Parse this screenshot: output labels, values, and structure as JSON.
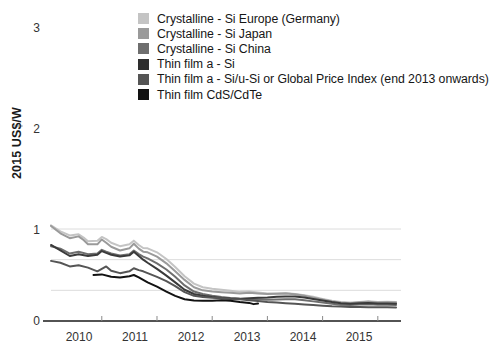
{
  "chart_data": {
    "type": "line",
    "title": "",
    "xlabel": "",
    "ylabel": "2015 US$/W",
    "xlim": [
      2009.58,
      2015.92
    ],
    "ylim": [
      0,
      3.25
    ],
    "grid": true,
    "gridlines_y": [
      1,
      2,
      3
    ],
    "legend_position": "top-right",
    "xticks": [
      "2010",
      "2011",
      "2012",
      "2013",
      "2014",
      "2015"
    ],
    "yticks": [
      "0",
      "1",
      "2",
      "3"
    ],
    "series": [
      {
        "name": "Crystalline - Si Europe (Germany)",
        "color": "#c4c4c4",
        "x": [
          2009.58,
          2009.75,
          2009.92,
          2010.08,
          2010.17,
          2010.25,
          2010.42,
          2010.5,
          2010.58,
          2010.67,
          2010.83,
          2011.0,
          2011.08,
          2011.17,
          2011.25,
          2011.33,
          2011.5,
          2011.67,
          2011.83,
          2012.0,
          2012.17,
          2012.33,
          2012.5,
          2012.67,
          2012.83,
          2013.0,
          2013.17,
          2013.33,
          2013.5,
          2013.67,
          2013.83,
          2014.0,
          2014.17,
          2014.33,
          2014.5,
          2014.67,
          2014.83,
          2015.0,
          2015.17,
          2015.33,
          2015.5,
          2015.67,
          2015.83
        ],
        "y": [
          3.12,
          2.92,
          2.79,
          2.83,
          2.72,
          2.6,
          2.62,
          2.74,
          2.67,
          2.55,
          2.44,
          2.5,
          2.62,
          2.48,
          2.38,
          2.37,
          2.24,
          2.02,
          1.76,
          1.46,
          1.22,
          1.1,
          1.05,
          1.02,
          0.99,
          0.95,
          0.96,
          0.93,
          0.9,
          0.9,
          0.91,
          0.88,
          0.84,
          0.79,
          0.72,
          0.66,
          0.62,
          0.6,
          0.62,
          0.64,
          0.62,
          0.63,
          0.62
        ]
      },
      {
        "name": "Crystalline - Si Japan",
        "color": "#9a9a9a",
        "x": [
          2009.58,
          2009.75,
          2009.92,
          2010.08,
          2010.17,
          2010.25,
          2010.42,
          2010.5,
          2010.58,
          2010.67,
          2010.83,
          2011.0,
          2011.08,
          2011.17,
          2011.25,
          2011.33,
          2011.5,
          2011.67,
          2011.83,
          2012.0,
          2012.17,
          2012.33,
          2012.5,
          2012.67,
          2012.83,
          2013.0,
          2013.17,
          2013.33,
          2013.5,
          2013.67,
          2013.83,
          2014.0,
          2014.17,
          2014.33,
          2014.5,
          2014.67,
          2014.83,
          2015.0,
          2015.17,
          2015.33,
          2015.5,
          2015.67,
          2015.83
        ],
        "y": [
          3.1,
          2.86,
          2.7,
          2.76,
          2.64,
          2.5,
          2.5,
          2.66,
          2.55,
          2.42,
          2.3,
          2.37,
          2.52,
          2.36,
          2.26,
          2.24,
          2.1,
          1.88,
          1.62,
          1.34,
          1.1,
          1.0,
          0.96,
          0.94,
          0.92,
          0.9,
          0.92,
          0.9,
          0.88,
          0.89,
          0.9,
          0.87,
          0.82,
          0.76,
          0.7,
          0.64,
          0.6,
          0.58,
          0.61,
          0.63,
          0.6,
          0.61,
          0.6
        ]
      },
      {
        "name": "Crystalline - Si China",
        "color": "#6e6e6e",
        "x": [
          2009.58,
          2009.75,
          2009.92,
          2010.08,
          2010.25,
          2010.42,
          2010.5,
          2010.58,
          2010.67,
          2010.83,
          2011.0,
          2011.08,
          2011.17,
          2011.25,
          2011.33,
          2011.5,
          2011.67,
          2011.83,
          2012.0,
          2012.17,
          2012.33,
          2012.5,
          2012.67,
          2012.83,
          2013.0,
          2013.17,
          2013.33,
          2013.5,
          2013.67,
          2013.83,
          2014.0,
          2014.17,
          2014.33,
          2014.5,
          2014.67,
          2014.83,
          2015.0,
          2015.17,
          2015.33,
          2015.5,
          2015.67,
          2015.83
        ],
        "y": [
          2.44,
          2.36,
          2.2,
          2.26,
          2.18,
          2.2,
          2.32,
          2.26,
          2.2,
          2.14,
          2.18,
          2.3,
          2.18,
          2.1,
          2.04,
          1.88,
          1.68,
          1.44,
          1.16,
          0.96,
          0.88,
          0.82,
          0.78,
          0.75,
          0.73,
          0.72,
          0.71,
          0.69,
          0.7,
          0.71,
          0.71,
          0.68,
          0.64,
          0.6,
          0.56,
          0.53,
          0.52,
          0.54,
          0.55,
          0.53,
          0.53,
          0.52
        ]
      },
      {
        "name": "Thin film a - Si",
        "color": "#3a3a3a",
        "x": [
          2009.58,
          2009.75,
          2009.92,
          2010.08,
          2010.25,
          2010.42,
          2010.5,
          2010.58,
          2010.67,
          2010.83,
          2011.0,
          2011.08,
          2011.17,
          2011.25,
          2011.33,
          2011.5,
          2011.67,
          2011.83,
          2012.0,
          2012.17,
          2012.33,
          2012.5,
          2012.67,
          2012.83,
          2013.0,
          2013.17,
          2013.33,
          2013.5,
          2013.67,
          2013.83,
          2014.0,
          2014.17,
          2014.33,
          2014.5,
          2014.67,
          2014.83,
          2015.0,
          2015.17,
          2015.33,
          2015.5,
          2015.67,
          2015.83
        ],
        "y": [
          2.48,
          2.3,
          2.12,
          2.18,
          2.12,
          2.16,
          2.28,
          2.22,
          2.16,
          2.1,
          2.14,
          2.26,
          2.12,
          2.0,
          1.9,
          1.7,
          1.48,
          1.26,
          1.02,
          0.88,
          0.82,
          0.78,
          0.75,
          0.73,
          0.72,
          0.74,
          0.76,
          0.77,
          0.79,
          0.8,
          0.8,
          0.77,
          0.72,
          0.67,
          0.62,
          0.58,
          0.56,
          0.58,
          0.59,
          0.57,
          0.57,
          0.56
        ]
      },
      {
        "name": "Thin film a - Si/u-Si or Global Price Index (end 2013 onwards)",
        "color": "#555555",
        "x": [
          2009.58,
          2009.75,
          2009.92,
          2010.08,
          2010.25,
          2010.42,
          2010.5,
          2010.58,
          2010.67,
          2010.83,
          2011.0,
          2011.08,
          2011.17,
          2011.25,
          2011.33,
          2011.5,
          2011.67,
          2011.83,
          2012.0,
          2012.17,
          2012.33,
          2012.5,
          2012.67,
          2012.83,
          2013.0,
          2013.17,
          2013.33,
          2013.5,
          2013.67,
          2013.83,
          2014.0,
          2014.17,
          2014.33,
          2014.5,
          2014.67,
          2014.83,
          2015.0,
          2015.17,
          2015.33,
          2015.5,
          2015.67,
          2015.83
        ],
        "y": [
          1.96,
          1.9,
          1.78,
          1.82,
          1.74,
          1.62,
          1.7,
          1.78,
          1.64,
          1.56,
          1.62,
          1.72,
          1.66,
          1.62,
          1.56,
          1.44,
          1.3,
          1.14,
          0.94,
          0.82,
          0.78,
          0.76,
          0.74,
          0.72,
          0.71,
          0.68,
          0.65,
          0.62,
          0.6,
          0.58,
          0.56,
          0.54,
          0.52,
          0.5,
          0.48,
          0.47,
          0.46,
          0.46,
          0.45,
          0.45,
          0.45,
          0.44
        ]
      },
      {
        "name": "Thin film CdS/CdTe",
        "color": "#121212",
        "x": [
          2010.35,
          2010.5,
          2010.67,
          2010.83,
          2011.0,
          2011.08,
          2011.17,
          2011.25,
          2011.33,
          2011.5,
          2011.67,
          2011.83,
          2012.0,
          2012.17,
          2012.33,
          2012.5,
          2012.67,
          2012.83,
          2013.0,
          2013.17,
          2013.25,
          2013.33
        ],
        "y": [
          1.5,
          1.52,
          1.44,
          1.42,
          1.46,
          1.5,
          1.42,
          1.34,
          1.26,
          1.12,
          0.96,
          0.82,
          0.71,
          0.67,
          0.66,
          0.66,
          0.68,
          0.66,
          0.62,
          0.59,
          0.55,
          0.57
        ]
      }
    ]
  },
  "axis": {
    "ylabel": "2015 US$/W",
    "yticks": [
      "3",
      "2",
      "1",
      "0"
    ],
    "xticks": [
      "2010",
      "2011",
      "2012",
      "2013",
      "2014",
      "2015"
    ]
  },
  "legend": {
    "items": [
      {
        "label": "Crystalline - Si Europe (Germany)",
        "color": "#c4c4c4"
      },
      {
        "label": "Crystalline - Si Japan",
        "color": "#9a9a9a"
      },
      {
        "label": "Crystalline - Si China",
        "color": "#6e6e6e"
      },
      {
        "label": "Thin film a - Si",
        "color": "#2e2e2e"
      },
      {
        "label": "Thin film a - Si/u-Si or Global Price Index (end 2013 onwards)",
        "color": "#555555"
      },
      {
        "label": "Thin film CdS/CdTe",
        "color": "#121212"
      }
    ]
  }
}
